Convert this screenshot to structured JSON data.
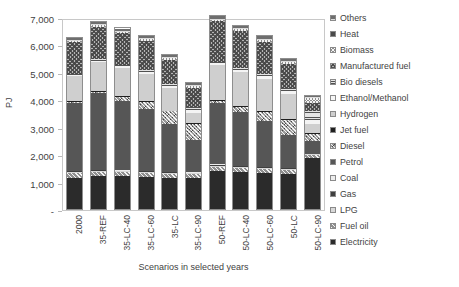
{
  "chart_data": {
    "type": "bar",
    "stacked": true,
    "title": "",
    "xlabel": "Scenarios in selected years",
    "ylabel": "PJ",
    "ylim": [
      0,
      7000
    ],
    "ytick_labels": [
      "-",
      "1,000",
      "2,000",
      "3,000",
      "4,000",
      "5,000",
      "6,000",
      "7,000"
    ],
    "ytick_values": [
      0,
      1000,
      2000,
      3000,
      4000,
      5000,
      6000,
      7000
    ],
    "grid": false,
    "legend_position": "right",
    "categories": [
      "2000",
      "35-REF",
      "35-LC-40",
      "35-LC-60",
      "35-LC",
      "35-LC-90",
      "50-REF",
      "50-LC-40",
      "50-LC-60",
      "50-LC",
      "50-LC-90"
    ],
    "series": [
      {
        "name": "Electricity",
        "color": "#2b2b2b",
        "pattern": "solid",
        "values": [
          1150,
          1230,
          1200,
          1180,
          1160,
          1150,
          1400,
          1360,
          1330,
          1300,
          1880
        ]
      },
      {
        "name": "Fuel oil",
        "color": "#8f8f8f",
        "pattern": "diagonal-up",
        "values": [
          180,
          150,
          150,
          145,
          140,
          135,
          160,
          155,
          150,
          145,
          120
        ]
      },
      {
        "name": "LPG",
        "color": "#d8d8d8",
        "pattern": "solid",
        "values": [
          40,
          35,
          35,
          35,
          35,
          35,
          40,
          38,
          36,
          35,
          30
        ]
      },
      {
        "name": "Gas",
        "color": "#3f3f3f",
        "pattern": "solid",
        "values": [
          30,
          25,
          25,
          25,
          25,
          25,
          30,
          28,
          26,
          25,
          20
        ]
      },
      {
        "name": "Coal",
        "color": "#ededed",
        "pattern": "solid",
        "values": [
          20,
          15,
          15,
          15,
          15,
          15,
          18,
          16,
          15,
          14,
          10
        ]
      },
      {
        "name": "Petrol",
        "color": "#565656",
        "pattern": "solid",
        "values": [
          2480,
          2820,
          2560,
          2300,
          1750,
          1180,
          2270,
          1990,
          1700,
          1220,
          480
        ]
      },
      {
        "name": "Diesel",
        "color": "#9a9a9a",
        "pattern": "diagonal-dots",
        "values": [
          60,
          55,
          150,
          260,
          480,
          620,
          70,
          190,
          340,
          560,
          250
        ]
      },
      {
        "name": "Jet fuel",
        "color": "#1f1f1f",
        "pattern": "solid",
        "values": [
          30,
          30,
          30,
          30,
          30,
          30,
          35,
          35,
          35,
          35,
          30
        ]
      },
      {
        "name": "Hydrogen",
        "color": "#cfcfcf",
        "pattern": "solid",
        "values": [
          900,
          1060,
          1040,
          1000,
          820,
          380,
          1280,
          1240,
          1180,
          900,
          340
        ]
      },
      {
        "name": "Ethanol/Methanol",
        "color": "#f4f4f4",
        "pattern": "solid",
        "values": [
          60,
          55,
          60,
          70,
          90,
          110,
          70,
          80,
          95,
          120,
          140
        ]
      },
      {
        "name": "Bio diesels",
        "color": "#e4e4e4",
        "pattern": "horizontal",
        "values": [
          50,
          50,
          55,
          65,
          80,
          110,
          60,
          70,
          85,
          110,
          330
        ]
      },
      {
        "name": "Manufactured fuel",
        "color": "#b5b5b5",
        "pattern": "checker",
        "values": [
          1150,
          1190,
          1160,
          1090,
          900,
          700,
          1480,
          1360,
          1180,
          880,
          310
        ]
      },
      {
        "name": "Biomass",
        "color": "#8d8d8d",
        "pattern": "cross",
        "values": [
          60,
          60,
          60,
          65,
          70,
          80,
          70,
          75,
          80,
          95,
          180
        ]
      },
      {
        "name": "Others",
        "color": "#6e6e6e",
        "pattern": "horizontal-thick",
        "values": [
          110,
          120,
          115,
          110,
          100,
          95,
          130,
          125,
          120,
          110,
          90
        ]
      }
    ]
  },
  "legend": {
    "items": [
      {
        "label": "Others"
      },
      {
        "label": "Heat"
      },
      {
        "label": "Biomass"
      },
      {
        "label": "Manufactured fuel"
      },
      {
        "label": "Bio diesels"
      },
      {
        "label": "Ethanol/Methanol"
      },
      {
        "label": "Hydrogen"
      },
      {
        "label": "Jet fuel"
      },
      {
        "label": "Diesel"
      },
      {
        "label": "Petrol"
      },
      {
        "label": "Coal"
      },
      {
        "label": "Gas"
      },
      {
        "label": "LPG"
      },
      {
        "label": "Fuel oil"
      },
      {
        "label": "Electricity"
      }
    ],
    "swatch_colors": [
      "#6e6e6e",
      "#4a4a4a",
      "#8d8d8d",
      "#b5b5b5",
      "#e4e4e4",
      "#f6f6f6",
      "#cfcfcf",
      "#1f1f1f",
      "#9a9a9a",
      "#565656",
      "#ededed",
      "#3f3f3f",
      "#d8d8d8",
      "#8f8f8f",
      "#2b2b2b"
    ]
  }
}
